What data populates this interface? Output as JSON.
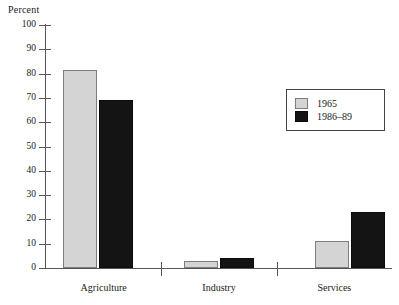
{
  "chart_data": {
    "type": "bar",
    "title": "",
    "xlabel": "",
    "ylabel": "Percent",
    "ylim": [
      0,
      100
    ],
    "ytick_step": 10,
    "yticks": [
      "100",
      "90",
      "80",
      "70",
      "60",
      "50",
      "40",
      "30",
      "20",
      "10",
      "0"
    ],
    "grid": false,
    "legend_position": "upper-right-inside",
    "categories": [
      "Agriculture",
      "Industry",
      "Services"
    ],
    "series": [
      {
        "name": "1965",
        "color": "#d4d4d4",
        "values": [
          81.5,
          3,
          11
        ]
      },
      {
        "name": "1986–89",
        "color": "#141414",
        "values": [
          69,
          4,
          23
        ]
      }
    ]
  },
  "axis": {
    "y_title": "Percent"
  },
  "legend": {
    "entries": [
      {
        "label": "1965"
      },
      {
        "label": "1986–89"
      }
    ]
  }
}
